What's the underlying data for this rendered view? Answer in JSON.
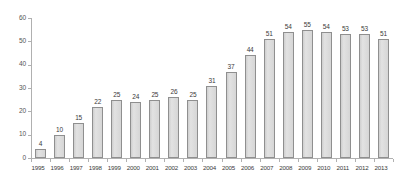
{
  "chart_data": {
    "type": "bar",
    "title": "",
    "subtitle": "",
    "xlabel": "",
    "ylabel": "",
    "ylim": [
      0,
      60
    ],
    "ytick_step": 10,
    "yticks": [
      "0",
      "10",
      "20",
      "30",
      "40",
      "50",
      "60"
    ],
    "grid": false,
    "legend": null,
    "categories": [
      "1995",
      "1996",
      "1997",
      "1998",
      "1999",
      "2000",
      "2001",
      "2002",
      "2003",
      "2004",
      "2005",
      "2006",
      "2007",
      "2008",
      "2009",
      "2010",
      "2011",
      "2012",
      "2013"
    ],
    "values": [
      4,
      10,
      15,
      22,
      25,
      24,
      25,
      26,
      25,
      31,
      37,
      44,
      51,
      54,
      55,
      54,
      53,
      53,
      51
    ],
    "data_labels": [
      "4",
      "10",
      "15",
      "22",
      "25",
      "24",
      "25",
      "26",
      "25",
      "31",
      "37",
      "44",
      "51",
      "54",
      "55",
      "54",
      "53",
      "53",
      "51"
    ],
    "colors": {
      "bar_fill": "#dadada",
      "bar_border": "#8f8f8f",
      "axis_line": "#b0b0b0",
      "tick_label": "#555555",
      "data_label": "#3a3a3a",
      "background": "#ffffff"
    }
  }
}
